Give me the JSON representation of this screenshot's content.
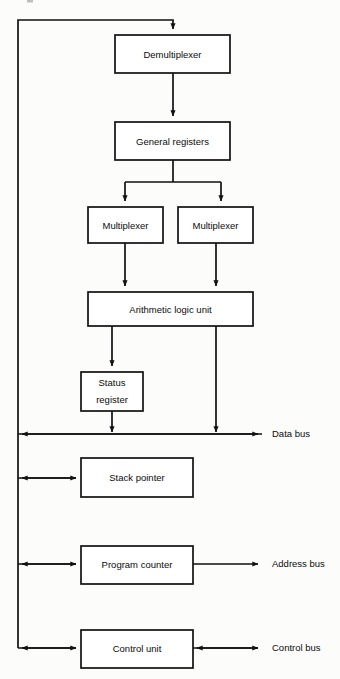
{
  "diagram": {
    "type": "block-diagram",
    "background_color": "#fcfcfa",
    "line_color": "#111111",
    "text_color": "#0b0b0b",
    "blocks": [
      {
        "id": "demultiplexer",
        "label": "Demultiplexer",
        "x": 115,
        "y": 35,
        "w": 115,
        "h": 38
      },
      {
        "id": "general-registers",
        "label": "General registers",
        "x": 115,
        "y": 122,
        "w": 115,
        "h": 38
      },
      {
        "id": "multiplexer-left",
        "label": "Multiplexer",
        "x": 88,
        "y": 207,
        "w": 75,
        "h": 36
      },
      {
        "id": "multiplexer-right",
        "label": "Multiplexer",
        "x": 178,
        "y": 207,
        "w": 75,
        "h": 36
      },
      {
        "id": "arithmetic-logic-unit",
        "label": "Arithmetic logic unit",
        "x": 88,
        "y": 292,
        "w": 165,
        "h": 34
      },
      {
        "id": "status-register",
        "label": "Status register",
        "x": 81,
        "y": 372,
        "w": 62,
        "h": 39,
        "line1": "Status",
        "line2": "register"
      },
      {
        "id": "stack-pointer",
        "label": "Stack pointer",
        "x": 81,
        "y": 458,
        "w": 112,
        "h": 39
      },
      {
        "id": "program-counter",
        "label": "Program counter",
        "x": 81,
        "y": 546,
        "w": 112,
        "h": 38
      },
      {
        "id": "control-unit",
        "label": "Control unit",
        "x": 81,
        "y": 630,
        "w": 112,
        "h": 38
      }
    ],
    "buses": [
      {
        "id": "data-bus",
        "label": "Data bus",
        "label_x": 272,
        "label_y": 434,
        "line_y": 434
      },
      {
        "id": "address-bus",
        "label": "Address bus",
        "label_x": 272,
        "label_y": 564,
        "line_y": 564
      },
      {
        "id": "control-bus",
        "label": "Control bus",
        "label_x": 272,
        "label_y": 648,
        "line_y": 648
      }
    ],
    "internal_bus": {
      "id": "internal-vertical-bus",
      "x": 18,
      "top_y": 20,
      "bottom_y": 648
    }
  }
}
